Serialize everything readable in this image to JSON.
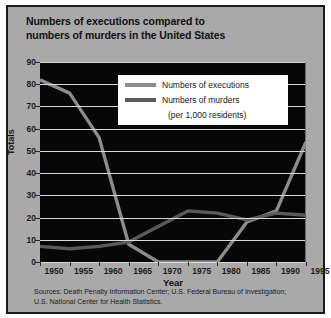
{
  "title": "Numbers of executions compared to numbers of murders in the United States",
  "title_line1": "Numbers of executions compared to",
  "title_line2": "numbers of murders in the United States",
  "legend": {
    "executions_label": "Numbers of executions",
    "murders_label": "Numbers of murders",
    "murders_sublabel": "(per 1,000 residents)",
    "executions_color": "#8c8c8c",
    "murders_color": "#5a5a5a"
  },
  "source_line1": "Sources: Death Penalty Information Center; U.S. Federal Bureau of Investigation;",
  "source_line2": "U.S. National Center for Health Statistics.",
  "colors": {
    "page_background": "#a9a9a9",
    "plot_background": "#070707",
    "gridline": "#d8d8d8",
    "text": "#1b1b1b",
    "frame_border": "#1b1b1b"
  },
  "chart_data": {
    "type": "line",
    "title": "Numbers of executions compared to numbers of murders in the United States",
    "xlabel": "Year",
    "ylabel": "Totals",
    "xlim": [
      1950,
      1995
    ],
    "ylim": [
      0,
      90
    ],
    "yticks": [
      0,
      10,
      20,
      30,
      40,
      50,
      60,
      70,
      80,
      90
    ],
    "xticks": [
      1950,
      1955,
      1960,
      1965,
      1970,
      1975,
      1980,
      1985,
      1990,
      1995
    ],
    "grid": "horizontal",
    "legend_position": "top-right-inside",
    "series": [
      {
        "name": "Numbers of executions",
        "color": "#8c8c8c",
        "x": [
          1950,
          1955,
          1960,
          1965,
          1970,
          1975,
          1980,
          1985,
          1990,
          1995
        ],
        "values": [
          82,
          76,
          56,
          8,
          0,
          0,
          0,
          18,
          23,
          54
        ]
      },
      {
        "name": "Numbers of murders (per 1,000 residents)",
        "color": "#5a5a5a",
        "x": [
          1950,
          1955,
          1960,
          1965,
          1970,
          1975,
          1980,
          1985,
          1990,
          1995
        ],
        "values": [
          7,
          6,
          7,
          9,
          16,
          23,
          22,
          19,
          22,
          21
        ]
      }
    ]
  }
}
